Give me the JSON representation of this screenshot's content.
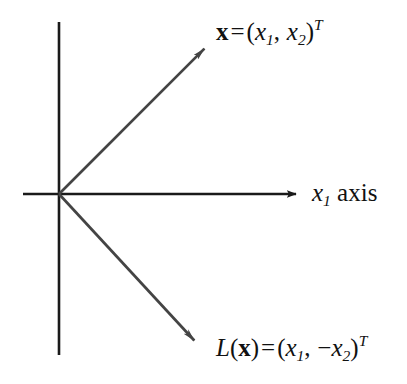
{
  "figure": {
    "background_color": "#ffffff",
    "axis_color": "#1a1a1a",
    "vector_color": "#444444",
    "text_color": "#111111",
    "width": 407,
    "height": 384
  },
  "axes": {
    "origin": {
      "x": 59,
      "y": 194
    },
    "horizontal": {
      "label_parts": {
        "var": "x",
        "sub": "1",
        "word": "axis"
      },
      "label_text": "x1 axis",
      "start_x": 23,
      "end_x": 305,
      "y": 194,
      "has_arrowhead": true
    },
    "vertical": {
      "x": 59,
      "start_y": 22,
      "end_y": 355,
      "has_arrowhead": false
    }
  },
  "vectors": [
    {
      "name": "x-vector",
      "label_parts": {
        "symbol": "x",
        "equals": "=",
        "open": "(",
        "first_var": "x",
        "first_sub": "1",
        "comma": ",",
        "sign": "",
        "second_var": "x",
        "second_sub": "2",
        "close": ")",
        "superscript": "T"
      },
      "label_text": "x = (x1, x2)T",
      "from": {
        "x": 59,
        "y": 194
      },
      "to": {
        "x": 213,
        "y": 40
      }
    },
    {
      "name": "lx-vector",
      "label_parts": {
        "func": "L",
        "open_arg": "(",
        "symbol": "x",
        "close_arg": ")",
        "equals": "=",
        "open": "(",
        "first_var": "x",
        "first_sub": "1",
        "comma": ",",
        "sign": "−",
        "second_var": "x",
        "second_sub": "2",
        "close": ")",
        "superscript": "T"
      },
      "label_text": "L(x) = (x1, -x2)T",
      "from": {
        "x": 59,
        "y": 194
      },
      "to": {
        "x": 203,
        "y": 350
      }
    }
  ]
}
